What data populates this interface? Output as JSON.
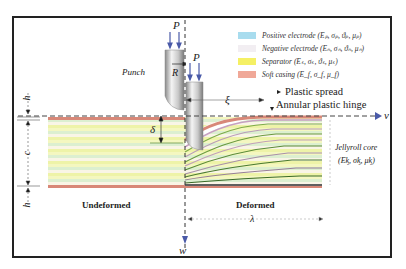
{
  "legend": {
    "items": [
      {
        "label": "Positive electrode (Eₚ, σₚ, ϑₚ, μₚ)",
        "color": "#a8dcee"
      },
      {
        "label": "Negative electrode (Eₙ, σₙ, ϑₙ, μₙ)",
        "color": "#f2eef2"
      },
      {
        "label": "Separator (Eₛ, σₛ, ϑₛ, μₛ)",
        "color": "#f5f064"
      },
      {
        "label": "Soft casing (E_f, σ_f, μ_f)",
        "color": "#f0a898"
      }
    ]
  },
  "labels": {
    "load_left": "P",
    "load_right": "P",
    "punch": "Punch",
    "radius": "R",
    "xi": "ξ",
    "plastic_spread": "Plastic spread",
    "annular_hinge": "Annular plastic hinge",
    "v_axis": "v",
    "w_axis": "w",
    "delta": "δ",
    "h_top": "h",
    "c": "c",
    "h_bottom": "h",
    "jellyroll": "Jellyroll core",
    "jellyroll_params": "(Eᶄ, σᶄ, μᶄ)",
    "undeformed": "Undeformed",
    "deformed": "Deformed",
    "lambda": "λ"
  },
  "colors": {
    "arrow_blue": "#4a5aa8",
    "frame": "#222222",
    "casing": "#d88878"
  }
}
